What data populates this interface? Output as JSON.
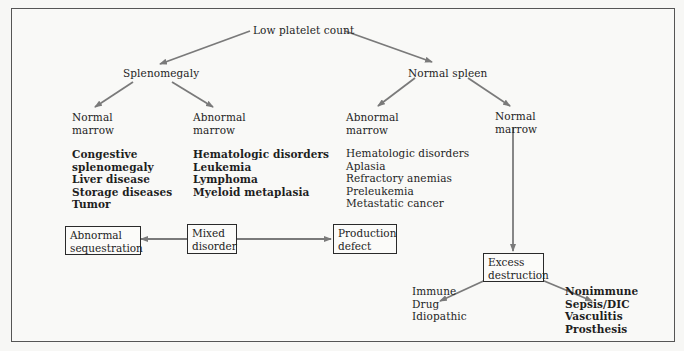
{
  "diagram": {
    "root": "Low platelet count",
    "level1": {
      "left": "Splenomegaly",
      "right": "Normal spleen"
    },
    "level2": [
      {
        "title": [
          "Normal",
          "marrow"
        ],
        "items": [
          "Congestive",
          "splenomegaly",
          "Liver disease",
          "Storage diseases",
          "Tumor"
        ]
      },
      {
        "title": [
          "Abnormal",
          "marrow"
        ],
        "items": [
          "Hematologic disorders",
          "Leukemia",
          "Lymphoma",
          "Myeloid metaplasia"
        ]
      },
      {
        "title": [
          "Abnormal",
          "marrow"
        ],
        "items": [
          "Hematologic disorders",
          "Aplasia",
          "Refractory anemias",
          "Preleukemia",
          "Metastatic cancer"
        ]
      },
      {
        "title": [
          "Normal",
          "marrow"
        ],
        "items": []
      }
    ],
    "boxes": {
      "abnormal_sequestration": [
        "Abnormal",
        "sequestration"
      ],
      "mixed_disorder": [
        "Mixed",
        "disorder"
      ],
      "production_defect": [
        "Production",
        "defect"
      ],
      "excess_destruction": [
        "Excess",
        "destruction"
      ]
    },
    "leaves": {
      "immune": [
        "Immune",
        "Drug",
        "Idiopathic"
      ],
      "nonimmune": [
        "Nonimmune",
        "Sepsis/DIC",
        "Vasculitis",
        "Prosthesis"
      ]
    },
    "colors": {
      "arrow": "#7a7a7a",
      "frame": "#555555",
      "text": "#1e1e1e",
      "background": "#f7f7f5"
    }
  }
}
